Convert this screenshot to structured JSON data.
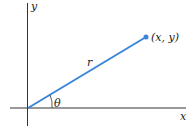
{
  "diagram": {
    "axes": {
      "x_label": "x",
      "y_label": "y"
    },
    "vector": {
      "label": "r",
      "color": "#3a86d6"
    },
    "point": {
      "label": "(x, y)"
    },
    "angle": {
      "label": "θ"
    }
  }
}
